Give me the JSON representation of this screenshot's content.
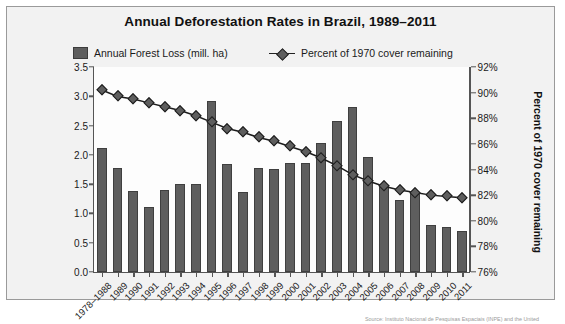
{
  "chart_data": {
    "type": "bar",
    "title": "Annual Deforestation Rates in Brazil, 1989–2011",
    "xlabel": "",
    "ylabel": "Annual Forest Loss (millions of hectares)",
    "y2label": "Percent of 1970 cover remaining",
    "ylim": [
      0.0,
      3.5
    ],
    "ylim2": [
      76,
      92
    ],
    "yticks": [
      "0.0",
      "0.5",
      "1.0",
      "1.5",
      "2.0",
      "2.5",
      "3.0",
      "3.5"
    ],
    "ytick_values": [
      0.0,
      0.5,
      1.0,
      1.5,
      2.0,
      2.5,
      3.0,
      3.5
    ],
    "yticks2": [
      "76%",
      "78%",
      "80%",
      "82%",
      "84%",
      "86%",
      "88%",
      "90%",
      "92%"
    ],
    "ytick2_values": [
      76,
      78,
      80,
      82,
      84,
      86,
      88,
      90,
      92
    ],
    "grid": false,
    "legend_position": "top",
    "categories": [
      "1978–1988",
      "1989",
      "1990",
      "1991",
      "1992",
      "1993",
      "1994",
      "1995",
      "1996",
      "1997",
      "1998",
      "1999",
      "2000",
      "2001",
      "2002",
      "2003",
      "2004",
      "2005",
      "2006",
      "2007",
      "2008",
      "2009",
      "2010",
      "2011"
    ],
    "series": [
      {
        "name": "Annual Forest Loss (mill. ha)",
        "type": "bar",
        "axis": "left",
        "color": "#5e5e5e",
        "values": [
          2.12,
          1.78,
          1.39,
          1.11,
          1.4,
          1.5,
          1.5,
          2.92,
          1.84,
          1.36,
          1.78,
          1.76,
          1.86,
          1.86,
          2.21,
          2.58,
          2.82,
          1.96,
          1.45,
          1.23,
          1.36,
          0.81,
          0.77,
          0.7
        ]
      },
      {
        "name": "Percent of 1970 cover remaining",
        "type": "line",
        "axis": "right",
        "color": "#1c1c1c",
        "values": [
          90.2,
          89.7,
          89.5,
          89.2,
          88.9,
          88.6,
          88.2,
          87.7,
          87.2,
          86.9,
          86.5,
          86.2,
          85.8,
          85.4,
          84.9,
          84.3,
          83.6,
          83.1,
          82.7,
          82.4,
          82.2,
          82.0,
          81.9,
          81.8
        ]
      }
    ]
  },
  "legend": {
    "bar_label": "Annual Forest Loss (mill. ha)",
    "line_label": "Percent of 1970 cover remaining"
  },
  "caption": {
    "text": "Source: Instituto Nacional de Pesquisas Espaciais (INPE) and the United"
  }
}
